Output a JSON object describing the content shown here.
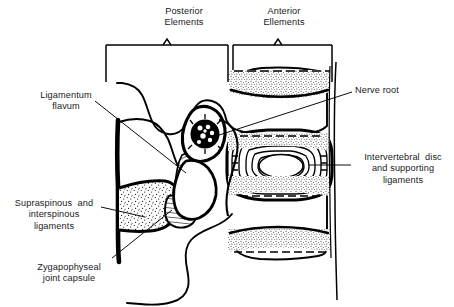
{
  "figure": {
    "kind": "anatomical-line-drawing",
    "ink_color": "#000000",
    "background_color": "#ffffff",
    "text_color": "#1a1a1a"
  },
  "brackets": [
    {
      "id": "posterior",
      "label": "Posterior\nElements"
    },
    {
      "id": "anterior",
      "label": "Anterior\nEllements"
    }
  ],
  "callouts": [
    {
      "id": "ligamentum-flavum",
      "label": "Ligamentum\nflavum",
      "side": "left",
      "points_to": "hatched band between the laminae"
    },
    {
      "id": "supraspinous-interspinous",
      "label": "Supraspinous  and\ninterspinous\nligaments",
      "side": "left",
      "points_to": "stippled wedge behind the spinous processes"
    },
    {
      "id": "zygapophyseal-joint-capsule",
      "label": "Zygapophyseal\njoint capsule",
      "side": "left",
      "points_to": "facet joint capsule"
    },
    {
      "id": "nerve-root",
      "label": "Nerve root",
      "side": "right",
      "points_to": "dark round nerve root in the intervertebral foramen"
    },
    {
      "id": "intervertebral-disc",
      "label": "Intervertebral  disc\nand supporting\nligaments",
      "side": "right",
      "points_to": "concentric annulus rings and central nucleus"
    }
  ],
  "structures": {
    "nerve_root": {
      "name": "nerve root",
      "fill": "#000000",
      "inner_dots": 7
    },
    "disc": {
      "name": "intervertebral disc",
      "annulus_rings": 7,
      "nucleus": "central oval",
      "endplates": "stippled"
    },
    "vertebral_bodies": {
      "count": 2,
      "endplates": "stippled"
    },
    "ligamentum_flavum": {
      "pattern": "diagonal hatching"
    },
    "interspinous_ligament": {
      "pattern": "stipple"
    }
  }
}
